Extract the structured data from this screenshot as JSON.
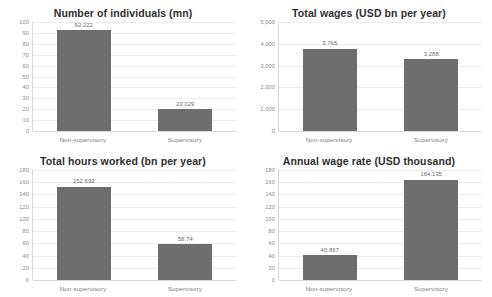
{
  "chart_data": [
    {
      "type": "bar",
      "id": "number-of-individuals",
      "title": "Number of individuals (mn)",
      "categories": [
        "Non-supervisory",
        "Supervisory"
      ],
      "values": [
        92.222,
        20.029
      ],
      "value_labels": [
        "92.222",
        "20.029"
      ],
      "xlabel": "",
      "ylabel": "",
      "ylim": [
        0,
        100
      ],
      "yticks": [
        0,
        10,
        20,
        30,
        40,
        50,
        60,
        70,
        80,
        90,
        100
      ],
      "ytick_labels": [
        "0",
        "10",
        "20",
        "30",
        "40",
        "50",
        "60",
        "70",
        "80",
        "90",
        "100"
      ],
      "grid": true,
      "legend": "none",
      "bar_color": "#6e6e6e"
    },
    {
      "type": "bar",
      "id": "total-wages",
      "title": "Total wages (USD bn per year)",
      "categories": [
        "Non-supervisory",
        "Supervisory"
      ],
      "values": [
        3765,
        3288
      ],
      "value_labels": [
        "3,765",
        "3,288"
      ],
      "xlabel": "",
      "ylabel": "",
      "ylim": [
        0,
        5000
      ],
      "yticks": [
        0,
        1000,
        2000,
        3000,
        4000,
        5000
      ],
      "ytick_labels": [
        "0",
        "1,000",
        "2,000",
        "3,000",
        "4,000",
        "5,000"
      ],
      "grid": true,
      "legend": "none",
      "bar_color": "#6e6e6e"
    },
    {
      "type": "bar",
      "id": "total-hours-worked",
      "title": "Total hours worked (bn per year)",
      "categories": [
        "Non-supervisory",
        "Supervisory"
      ],
      "values": [
        152.692,
        58.74
      ],
      "value_labels": [
        "152.692",
        "58.74"
      ],
      "xlabel": "",
      "ylabel": "",
      "ylim": [
        0,
        180
      ],
      "yticks": [
        0,
        20,
        40,
        60,
        80,
        100,
        120,
        140,
        160,
        180
      ],
      "ytick_labels": [
        "0",
        "20",
        "40",
        "60",
        "80",
        "100",
        "120",
        "140",
        "160",
        "180"
      ],
      "grid": true,
      "legend": "none",
      "bar_color": "#6e6e6e"
    },
    {
      "type": "bar",
      "id": "annual-wage-rate",
      "title": "Annual wage rate (USD thousand)",
      "categories": [
        "Non-supervisory",
        "Supervisory"
      ],
      "values": [
        40.867,
        164.135
      ],
      "value_labels": [
        "40.867",
        "164.135"
      ],
      "xlabel": "",
      "ylabel": "",
      "ylim": [
        0,
        180
      ],
      "yticks": [
        0,
        20,
        40,
        60,
        80,
        100,
        120,
        140,
        160,
        180
      ],
      "ytick_labels": [
        "0",
        "20",
        "40",
        "60",
        "80",
        "100",
        "120",
        "140",
        "160",
        "180"
      ],
      "grid": true,
      "legend": "none",
      "bar_color": "#6e6e6e"
    }
  ]
}
